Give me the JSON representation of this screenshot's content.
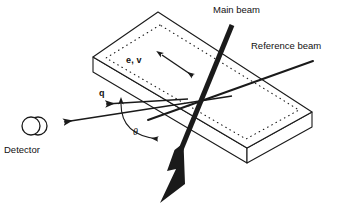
{
  "figure": {
    "background_color": "#ffffff",
    "line_color": "#1a1a1a",
    "width": 339,
    "height": 210
  },
  "labels": {
    "main_beam": "Main beam",
    "reference_beam": "Reference beam",
    "detector": "Detector",
    "polarization_velocity": "e, v",
    "scattering_vector": "q",
    "scattering_angle": "θ"
  },
  "elements": {
    "sample_slab": {
      "name": "rectangular slab sample",
      "style": "3D parallelepiped, solid outline with dotted inner top-face border",
      "top_face_points": "158,12 93,57 247,148 312,112",
      "thickness_px": 28
    },
    "main_beam": {
      "name": "main beam",
      "style": "thick solid black line with large solid arrowhead",
      "from": "232,25",
      "to": "160,200",
      "stroke_width": 5
    },
    "reference_beam": {
      "name": "reference beam",
      "style": "thin solid black line",
      "from": "312,62",
      "to": "150,119",
      "stroke_width": 2
    },
    "scattered_beam": {
      "name": "scattered beam toward detector",
      "style": "solid line with open arrowhead pointing left",
      "from": "230,97",
      "to": "62,122",
      "stroke_width": 1.6
    },
    "q_vector": {
      "name": "scattering vector q",
      "style": "solid line with arrowhead pointing left",
      "from": "186,99",
      "to": "104,104",
      "stroke_width": 1.6
    },
    "polarization_arrow": {
      "name": "double-headed polarization arrow",
      "style": "double-headed arrow",
      "from": "158,52",
      "to": "196,78"
    },
    "angle_arc": {
      "name": "scattering angle arc",
      "style": "curved arc with arrowheads at both ends",
      "between": "q vector and main beam"
    },
    "detector": {
      "name": "detector",
      "style": "two overlapping circles (cylindrical detector)",
      "center": "33,126",
      "radius": 9
    }
  }
}
